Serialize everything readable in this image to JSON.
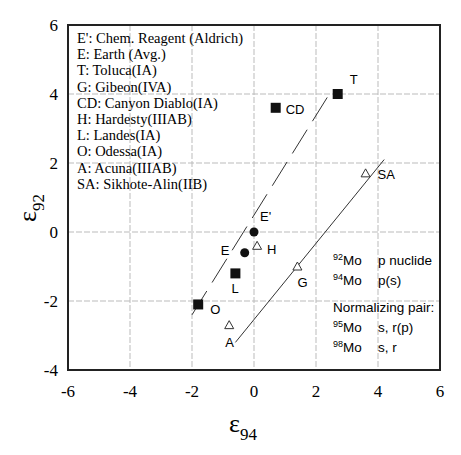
{
  "chart_data": {
    "type": "scatter",
    "title": "",
    "xlabel": "ε94",
    "ylabel": "ε92",
    "xlabel_main": "ε",
    "xlabel_sub": "94",
    "ylabel_main": "ε",
    "ylabel_sub": "92",
    "xlim": [
      -6,
      6
    ],
    "ylim": [
      -4,
      6
    ],
    "xticks": [
      -6,
      -4,
      -2,
      0,
      2,
      4,
      6
    ],
    "yticks": [
      -4,
      -2,
      0,
      2,
      4,
      6
    ],
    "grid": true,
    "series": [
      {
        "name": "Chem. Reagent / Earth",
        "marker": "circle-filled",
        "points": [
          {
            "label": "E'",
            "x": 0.0,
            "y": 0.0
          },
          {
            "label": "E",
            "x": -0.3,
            "y": -0.6
          }
        ]
      },
      {
        "name": "Iron meteorites (IA)",
        "marker": "square-filled",
        "points": [
          {
            "label": "T",
            "x": 2.7,
            "y": 4.0
          },
          {
            "label": "CD",
            "x": 0.7,
            "y": 3.6
          },
          {
            "label": "L",
            "x": -0.6,
            "y": -1.2
          },
          {
            "label": "O",
            "x": -1.8,
            "y": -2.1
          }
        ]
      },
      {
        "name": "Other iron meteorites",
        "marker": "triangle-open",
        "points": [
          {
            "label": "H",
            "x": 0.1,
            "y": -0.4
          },
          {
            "label": "G",
            "x": 1.4,
            "y": -1.0
          },
          {
            "label": "A",
            "x": -0.8,
            "y": -2.7
          },
          {
            "label": "SA",
            "x": 3.6,
            "y": 1.7
          }
        ]
      }
    ],
    "lines": [
      {
        "name": "upper trend",
        "style": "dashed",
        "x": [
          -2.0,
          2.5
        ],
        "y": [
          -2.4,
          4.1
        ]
      },
      {
        "name": "lower trend",
        "style": "solid",
        "x": [
          -0.6,
          4.2
        ],
        "y": [
          -3.2,
          2.1
        ]
      }
    ],
    "legend": [
      "E':  Chem. Reagent (Aldrich)",
      "E: Earth (Avg.)",
      "T: Toluca(IA)",
      "G: Gibeon(IVA)",
      "CD: Canyon Diablo(IA)",
      "H: Hardesty(IIIAB)",
      "L: Landes(IA)",
      "O: Odessa(IA)",
      "A: Acuna(IIIAB)",
      "SA: Sikhote-Alin(IIB)"
    ],
    "annotations": {
      "nuclides": [
        {
          "mass": "92",
          "element": "Mo",
          "desc": "p nuclide"
        },
        {
          "mass": "94",
          "element": "Mo",
          "desc": "p(s)"
        }
      ],
      "normalizing_title": "Normalizing pair:",
      "normalizing": [
        {
          "mass": "95",
          "element": "Mo",
          "desc": "s, r(p)"
        },
        {
          "mass": "98",
          "element": "Mo",
          "desc": "s, r"
        }
      ]
    }
  }
}
